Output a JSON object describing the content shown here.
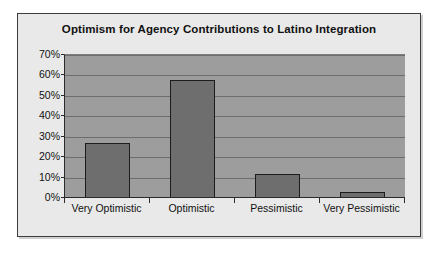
{
  "chart_data": {
    "type": "bar",
    "title": "Optimism for Agency Contributions to Latino Integration",
    "categories": [
      "Very Optimistic",
      "Optimistic",
      "Pessimistic",
      "Very Pessimistic"
    ],
    "values": [
      27,
      58,
      12,
      3
    ],
    "xlabel": "",
    "ylabel": "",
    "ylim": [
      0,
      70
    ],
    "ytick_labels": [
      "70%",
      "60%",
      "50%",
      "40%",
      "30%",
      "20%",
      "10%",
      "0%"
    ],
    "ytick_values": [
      70,
      60,
      50,
      40,
      30,
      20,
      10,
      0
    ],
    "grid": true,
    "legend": false,
    "colors": {
      "bar_fill": "#6e6e6e",
      "bar_outline": "#1c1c1c",
      "plot_background": "#9d9d9d",
      "chart_background": "#e9e9e9",
      "gridline": "#6d6d6d",
      "axis": "#2a2a2a",
      "text": "#111111"
    }
  }
}
